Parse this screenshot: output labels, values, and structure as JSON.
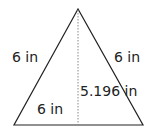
{
  "diagram": {
    "shape": "equilateral triangle with altitude",
    "labels": {
      "left_side": "6 in",
      "right_side": "6 in",
      "base": "6 in",
      "height": "5.196 in"
    },
    "colors": {
      "stroke": "#222222",
      "altitude": "#888888",
      "text": "#222222"
    }
  }
}
